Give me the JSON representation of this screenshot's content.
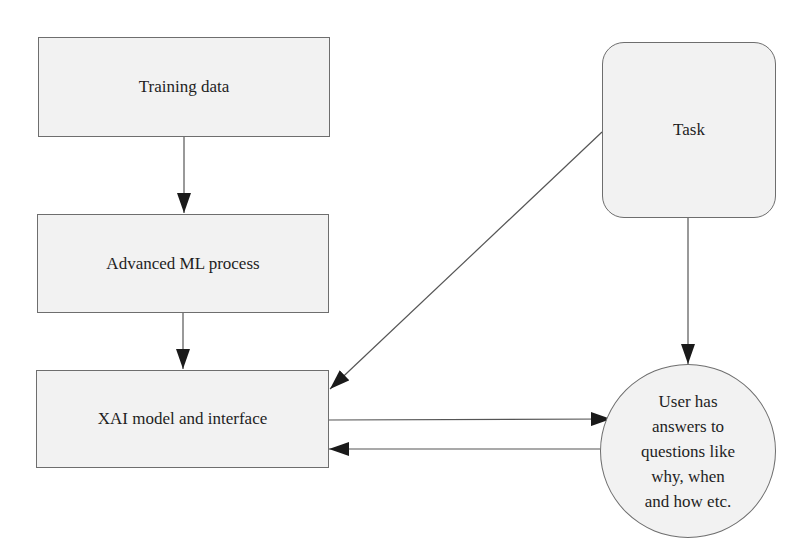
{
  "diagram": {
    "type": "flowchart",
    "nodes": [
      {
        "id": "training_data",
        "label": "Training data",
        "shape": "rectangle"
      },
      {
        "id": "advanced_ml",
        "label": "Advanced ML process",
        "shape": "rectangle"
      },
      {
        "id": "xai_model",
        "label": "XAI model and interface",
        "shape": "rectangle"
      },
      {
        "id": "task",
        "label": "Task",
        "shape": "rounded-rectangle"
      },
      {
        "id": "user_answers",
        "label": "User has\nanswers to\nquestions like\nwhy, when\nand how etc.",
        "shape": "circle"
      }
    ],
    "edges": [
      {
        "from": "training_data",
        "to": "advanced_ml"
      },
      {
        "from": "advanced_ml",
        "to": "xai_model"
      },
      {
        "from": "task",
        "to": "xai_model"
      },
      {
        "from": "task",
        "to": "user_answers"
      },
      {
        "from": "xai_model",
        "to": "user_answers"
      },
      {
        "from": "user_answers",
        "to": "xai_model"
      }
    ]
  },
  "colors": {
    "node_fill": "#f2f2f2",
    "node_border": "#6e6e6e",
    "edge": "#555555",
    "arrowhead": "#1a1a1a"
  }
}
